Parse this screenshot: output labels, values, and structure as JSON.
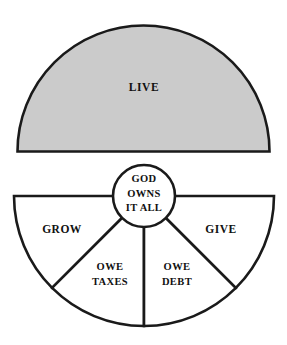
{
  "diagram": {
    "type": "stewardship-pie-diagram",
    "title_text": "",
    "colors": {
      "background": "#ffffff",
      "outline": "#1a1a1a",
      "live_fill": "#cbcbcb",
      "wedge_fill": "#ffffff",
      "text": "#111111"
    },
    "top_half": {
      "name": "live-semicircle",
      "label": "LIVE",
      "fill": "#cbcbcb"
    },
    "center_circle": {
      "name": "god-owns-it-all-circle",
      "lines": [
        "GOD",
        "OWNS",
        "IT ALL"
      ]
    },
    "bottom_wedges": [
      {
        "id": "grow",
        "label_lines": [
          "GROW"
        ],
        "position": "outer-left"
      },
      {
        "id": "owe-taxes",
        "label_lines": [
          "OWE",
          "TAXES"
        ],
        "position": "inner-left"
      },
      {
        "id": "owe-debt",
        "label_lines": [
          "OWE",
          "DEBT"
        ],
        "position": "inner-right"
      },
      {
        "id": "give",
        "label_lines": [
          "GIVE"
        ],
        "position": "outer-right"
      }
    ]
  }
}
